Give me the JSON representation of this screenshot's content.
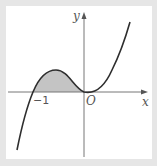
{
  "figure": {
    "function": "y = x^2(x+1)",
    "axis_labels": {
      "x": "x",
      "y": "y"
    },
    "origin_label": "O",
    "tick_labels": [
      {
        "x": -1,
        "label": "−1"
      }
    ],
    "shaded_region": {
      "from": -1,
      "to": 0,
      "fill": "#c4c4c4"
    },
    "colors": {
      "background": "#e6e6e6",
      "panel": "#ffffff",
      "curve": "#333333",
      "axes": "#666666"
    }
  }
}
